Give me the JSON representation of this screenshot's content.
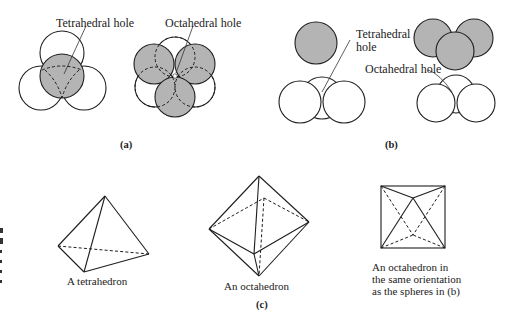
{
  "figure": {
    "panel_a": {
      "caption": "(a)",
      "labels": {
        "tetrahedral_hole": "Tetrahedral hole",
        "octahedral_hole": "Octahedral hole"
      }
    },
    "panel_b": {
      "caption": "(b)",
      "labels": {
        "tetrahedral_hole_line1": "Tetrahedral",
        "tetrahedral_hole_line2": "hole",
        "octahedral_hole": "Octahedral hole"
      }
    },
    "panel_c": {
      "caption": "(c)",
      "tetrahedron_label": "A tetrahedron",
      "octahedron_label": "An octahedron",
      "oriented_octahedron_label": {
        "line1": "An octahedron in",
        "line2": "the same orientation",
        "line3": "as the spheres in (b)"
      }
    },
    "colors": {
      "shaded_sphere": "#b4b4b4",
      "open_sphere": "#ffffff",
      "line": "#1e1e1e"
    }
  }
}
